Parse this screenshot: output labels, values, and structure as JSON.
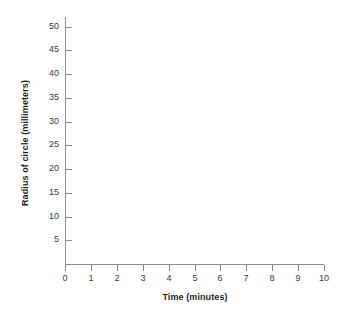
{
  "chart_data": {
    "type": "line",
    "title": "",
    "subtitle": "",
    "xlabel": "Time (minutes)",
    "ylabel": "Radius of circle (millimeters)",
    "xlim": [
      0,
      10
    ],
    "ylim": [
      0,
      52
    ],
    "x_tick_labels": [
      "0",
      "1",
      "2",
      "3",
      "4",
      "5",
      "6",
      "7",
      "8",
      "9",
      "10"
    ],
    "x_ticks": [
      0,
      1,
      2,
      3,
      4,
      5,
      6,
      7,
      8,
      9,
      10
    ],
    "y_tick_labels": [
      "5",
      "10",
      "15",
      "20",
      "25",
      "30",
      "35",
      "40",
      "45",
      "50"
    ],
    "y_ticks": [
      5,
      10,
      15,
      20,
      25,
      30,
      35,
      40,
      45,
      50
    ],
    "grid": false,
    "legend": false,
    "legend_position": "none",
    "series": [],
    "x": [],
    "values": [],
    "annotations": [],
    "note": "Blank coordinate grid template; no data points plotted in the plot area."
  },
  "axes": {
    "y_axis_title": "Radius of circle (millimeters)",
    "x_axis_title": "Time (minutes)",
    "axis_color": "#8c8c8c",
    "tick_label_color": "#3a3a3a",
    "title_color": "#1f1f1f",
    "background_color": "#ffffff"
  }
}
